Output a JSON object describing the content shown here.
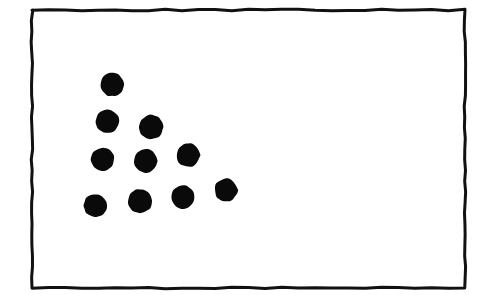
{
  "figure": {
    "kind": "dot-pattern-diagram",
    "canvas": {
      "width": 487,
      "height": 295
    },
    "background_color": "#ffffff",
    "ink_color": "#0a0a0a"
  },
  "frame": {
    "name": "hand-drawn rectangle border",
    "x": 32,
    "y": 10,
    "width": 433,
    "height": 278,
    "stroke_color": "#111111",
    "stroke_width": 3,
    "fill_color": "#ffffff",
    "style": "hand-drawn"
  },
  "dots": {
    "count": 11,
    "color": "#0a0a0a",
    "default_radius": 11.5,
    "rows": [
      {
        "row": 1,
        "count": 1
      },
      {
        "row": 2,
        "count": 2
      },
      {
        "row": 3,
        "count": 3
      },
      {
        "row": 4,
        "count": 4
      },
      {
        "row": 5,
        "count": 1
      }
    ],
    "items": [
      {
        "id": "dot-1",
        "cx": 112,
        "cy": 84.5,
        "r": 11.8
      },
      {
        "id": "dot-2",
        "cx": 107.5,
        "cy": 121.5,
        "r": 11.8
      },
      {
        "id": "dot-3",
        "cx": 151,
        "cy": 127,
        "r": 12.2
      },
      {
        "id": "dot-4",
        "cx": 102.5,
        "cy": 159.5,
        "r": 11.8
      },
      {
        "id": "dot-5",
        "cx": 146,
        "cy": 161,
        "r": 11.8
      },
      {
        "id": "dot-6",
        "cx": 188,
        "cy": 155,
        "r": 11.8
      },
      {
        "id": "dot-7",
        "cx": 95.5,
        "cy": 205.5,
        "r": 11.8
      },
      {
        "id": "dot-8",
        "cx": 140,
        "cy": 201,
        "r": 12.2
      },
      {
        "id": "dot-9",
        "cx": 183,
        "cy": 197,
        "r": 11.8
      },
      {
        "id": "dot-10",
        "cx": 226,
        "cy": 190,
        "r": 11.5
      },
      {
        "id": "dot-11",
        "cx": 112,
        "cy": 84.5,
        "r": 0
      }
    ]
  },
  "chart_data": {
    "type": "scatter",
    "title": "",
    "xlabel": "",
    "ylabel": "",
    "grid": false,
    "legend": null,
    "xlim": [
      32,
      465
    ],
    "ylim": [
      288,
      10
    ],
    "note": "Pixel coordinates; y increases downward in image space.",
    "series": [
      {
        "name": "dots",
        "marker": "filled-circle",
        "color": "#0a0a0a",
        "x": [
          112,
          107.5,
          151,
          102.5,
          146,
          188,
          95.5,
          140,
          183,
          226
        ],
        "y": [
          84.5,
          121.5,
          127,
          159.5,
          161,
          155,
          205.5,
          201,
          197,
          190
        ]
      }
    ]
  }
}
